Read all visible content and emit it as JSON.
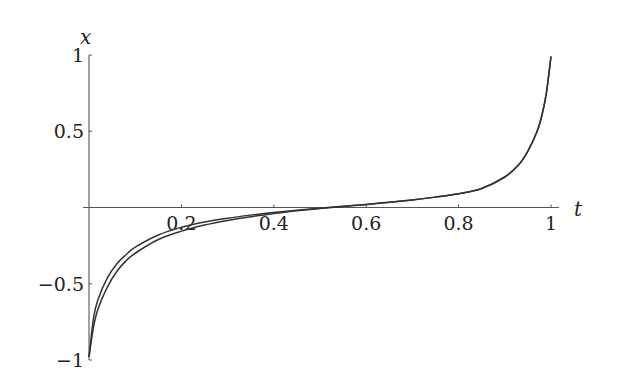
{
  "chart_data": {
    "type": "line",
    "title": "",
    "xlabel": "t",
    "ylabel": "x",
    "xlim": [
      0,
      1
    ],
    "ylim": [
      -1,
      1
    ],
    "grid": false,
    "legend": null,
    "x_ticks": [
      {
        "value": 0.2,
        "label": "0.2"
      },
      {
        "value": 0.4,
        "label": "0.4"
      },
      {
        "value": 0.6,
        "label": "0.6"
      },
      {
        "value": 0.8,
        "label": "0.8"
      },
      {
        "value": 1,
        "label": "1"
      }
    ],
    "y_ticks": [
      {
        "value": 1,
        "label": "1"
      },
      {
        "value": 0.5,
        "label": "0.5"
      },
      {
        "value": -0.5,
        "label": "−0.5"
      },
      {
        "value": -1,
        "label": "−1"
      }
    ],
    "series": [
      {
        "name": "curve-upper",
        "x": [
          0,
          0.01,
          0.02,
          0.04,
          0.06,
          0.08,
          0.1,
          0.15,
          0.2,
          0.25,
          0.3,
          0.35,
          0.4,
          0.45,
          0.5,
          0.55,
          0.6,
          0.65,
          0.7,
          0.75,
          0.8,
          0.85,
          0.9,
          0.93,
          0.95,
          0.97,
          0.98,
          0.99,
          1.0
        ],
        "y": [
          -0.98,
          -0.72,
          -0.6,
          -0.46,
          -0.37,
          -0.31,
          -0.26,
          -0.18,
          -0.13,
          -0.095,
          -0.07,
          -0.05,
          -0.033,
          -0.018,
          -0.005,
          0.008,
          0.02,
          0.035,
          0.05,
          0.068,
          0.09,
          0.125,
          0.2,
          0.28,
          0.37,
          0.5,
          0.6,
          0.75,
          0.99
        ]
      },
      {
        "name": "curve-lower",
        "x": [
          0,
          0.01,
          0.02,
          0.04,
          0.06,
          0.08,
          0.1,
          0.15,
          0.2,
          0.25,
          0.3,
          0.35,
          0.4,
          0.45,
          0.5,
          0.55,
          0.6,
          0.65,
          0.7,
          0.75,
          0.8,
          0.85,
          0.9,
          0.93,
          0.95,
          0.97,
          0.98,
          0.99,
          1.0
        ],
        "y": [
          -0.98,
          -0.78,
          -0.66,
          -0.52,
          -0.42,
          -0.35,
          -0.3,
          -0.21,
          -0.155,
          -0.115,
          -0.085,
          -0.06,
          -0.04,
          -0.022,
          -0.007,
          0.007,
          0.019,
          0.034,
          0.05,
          0.068,
          0.09,
          0.125,
          0.2,
          0.28,
          0.37,
          0.5,
          0.6,
          0.75,
          0.99
        ]
      }
    ]
  }
}
